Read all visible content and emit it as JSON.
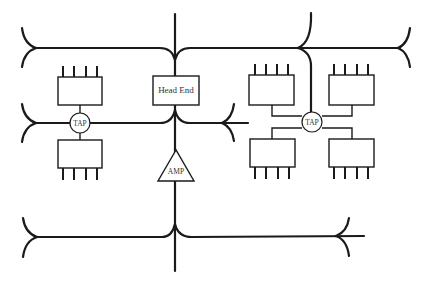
{
  "diagram": {
    "title": "",
    "head_end": {
      "label": "Head End"
    },
    "amplifier": {
      "label": "AMP"
    },
    "taps": [
      {
        "id": "tap-left",
        "label": "TAP",
        "subscribers": 2
      },
      {
        "id": "tap-right",
        "label": "TAP",
        "subscribers": 4
      }
    ],
    "colors": {
      "line": "#1a1a1a",
      "text": "#333333",
      "background": "#ffffff"
    }
  }
}
